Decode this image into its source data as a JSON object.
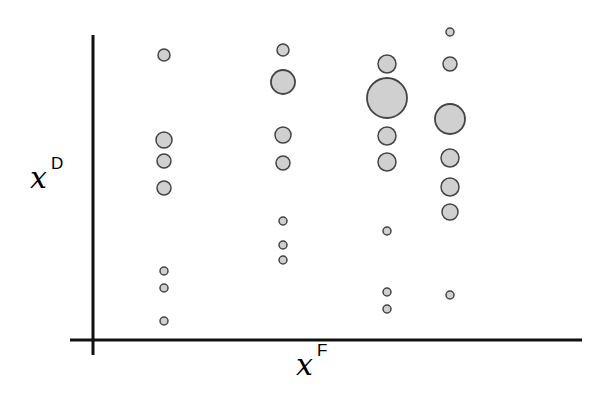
{
  "chart_data": {
    "type": "scatter",
    "title": "",
    "xlabel": {
      "base": "x",
      "sup": "F"
    },
    "ylabel": {
      "base": "x",
      "sup": "D"
    },
    "grid": false,
    "legend": null,
    "style": {
      "fill": "#d0d0d0",
      "stroke": "#444444",
      "axis_color": "#111111"
    },
    "columns": [
      {
        "x": 164,
        "points": [
          {
            "y": 55,
            "r": 6
          },
          {
            "y": 140,
            "r": 8
          },
          {
            "y": 161,
            "r": 7
          },
          {
            "y": 188,
            "r": 7
          },
          {
            "y": 271,
            "r": 4
          },
          {
            "y": 288,
            "r": 4
          },
          {
            "y": 321,
            "r": 4
          }
        ]
      },
      {
        "x": 283,
        "points": [
          {
            "y": 50,
            "r": 6
          },
          {
            "y": 82,
            "r": 12
          },
          {
            "y": 135,
            "r": 8
          },
          {
            "y": 163,
            "r": 7
          },
          {
            "y": 221,
            "r": 4
          },
          {
            "y": 245,
            "r": 4
          },
          {
            "y": 260,
            "r": 4
          }
        ]
      },
      {
        "x": 387,
        "points": [
          {
            "y": 64,
            "r": 9
          },
          {
            "y": 98,
            "r": 20
          },
          {
            "y": 136,
            "r": 9
          },
          {
            "y": 162,
            "r": 9
          },
          {
            "y": 231,
            "r": 4
          },
          {
            "y": 292,
            "r": 4
          },
          {
            "y": 309,
            "r": 4
          }
        ]
      },
      {
        "x": 450,
        "points": [
          {
            "y": 32,
            "r": 4
          },
          {
            "y": 64,
            "r": 7
          },
          {
            "y": 119,
            "r": 15
          },
          {
            "y": 158,
            "r": 9
          },
          {
            "y": 187,
            "r": 9
          },
          {
            "y": 212,
            "r": 8
          },
          {
            "y": 295,
            "r": 4
          }
        ]
      }
    ],
    "axes": {
      "y_axis": {
        "x": 93,
        "y1": 35,
        "y2": 355
      },
      "x_axis": {
        "y": 340,
        "x1": 70,
        "x2": 582
      }
    }
  }
}
